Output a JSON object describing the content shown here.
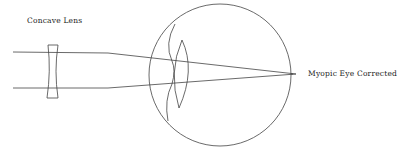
{
  "diagram": {
    "labels": {
      "lens": "Concave Lens",
      "eye": "Myopic Eye Corrected"
    },
    "colors": {
      "stroke": "#444444",
      "background": "#ffffff",
      "text": "#222222"
    },
    "elements": [
      "incoming-parallel-rays",
      "concave-lens",
      "eyeball",
      "cornea",
      "crystalline-lens",
      "focal-point-on-retina"
    ]
  }
}
